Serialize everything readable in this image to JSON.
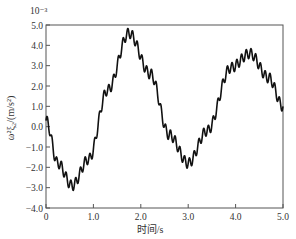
{
  "chart_data": {
    "type": "line",
    "title": "",
    "xlabel": "时间/s",
    "ylabel": "ω²ξ₂/(m/s²)",
    "y_scale_note": "10⁻³",
    "xlim": [
      0,
      5.0
    ],
    "ylim": [
      -4.0,
      5.0
    ],
    "grid": false,
    "legend": null,
    "x_ticks": [
      "0",
      "1.0",
      "2.0",
      "3.0",
      "4.0",
      "5.0"
    ],
    "y_ticks": [
      "-4.0",
      "-3.0",
      "-2.0",
      "-1.0",
      "0.0",
      "1.0",
      "2.0",
      "3.0",
      "4.0",
      "5.0"
    ],
    "series": [
      {
        "name": "ω²ξ₂",
        "color": "#111111",
        "description": "slow oscillation with superimposed high-frequency ripple (~10 Hz, amplitude ≈0.25×10⁻³)",
        "envelope_points": {
          "x": [
            0.0,
            0.25,
            0.55,
            0.9,
            1.3,
            1.75,
            2.2,
            2.6,
            3.0,
            3.4,
            3.9,
            4.3,
            4.7,
            5.0
          ],
          "y": [
            0.3,
            -1.8,
            -2.9,
            -1.6,
            1.8,
            4.6,
            2.6,
            -0.4,
            -1.8,
            -0.2,
            2.9,
            3.6,
            2.4,
            1.0
          ]
        },
        "ripple": {
          "frequency_hz": 10,
          "amplitude": 0.25
        }
      }
    ]
  }
}
